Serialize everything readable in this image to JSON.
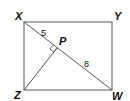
{
  "figure": {
    "type": "geometry-rectangle",
    "vertices": {
      "X": {
        "label": "X",
        "x": 24,
        "y": 22
      },
      "Y": {
        "label": "Y",
        "x": 112,
        "y": 22
      },
      "Z": {
        "label": "Z",
        "x": 24,
        "y": 90
      },
      "W": {
        "label": "W",
        "x": 112,
        "y": 90
      }
    },
    "point_P": {
      "label": "P",
      "x": 57,
      "y": 48
    },
    "segments": [
      {
        "from": "X",
        "to": "Y"
      },
      {
        "from": "Y",
        "to": "W"
      },
      {
        "from": "W",
        "to": "Z"
      },
      {
        "from": "Z",
        "to": "X"
      },
      {
        "from": "X",
        "to": "W"
      },
      {
        "from": "Z",
        "to": "P"
      }
    ],
    "measurements": {
      "XP": "5",
      "PW": "8"
    },
    "right_angle_at": "P",
    "line_color": "#555555"
  }
}
